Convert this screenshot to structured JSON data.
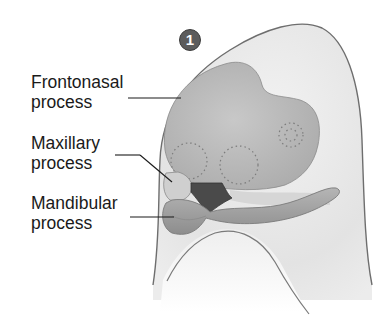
{
  "diagram": {
    "step_badge": "1",
    "labels": [
      {
        "line1": "Frontonasal",
        "line2": "process"
      },
      {
        "line1": "Maxillary",
        "line2": "process"
      },
      {
        "line1": "Mandibular",
        "line2": "process"
      }
    ],
    "colors": {
      "outline": "#6e6e6e",
      "head_fill": "#e6e6e6",
      "frontonasal_fill": "#b9b9b9",
      "stomodeum_fill": "#4a4a4a",
      "badge_fill": "#5c5c5c",
      "text": "#1a1a1a"
    }
  }
}
